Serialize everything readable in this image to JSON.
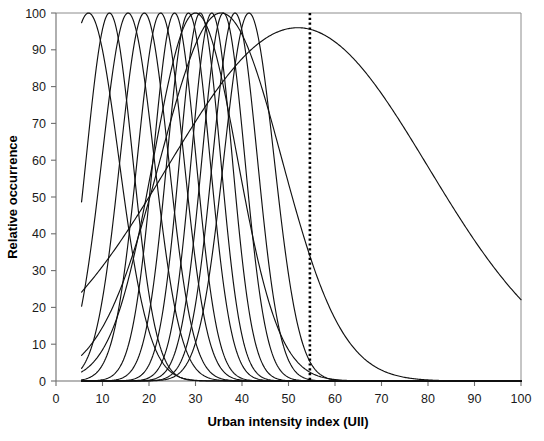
{
  "chart_data": {
    "type": "line",
    "title": "",
    "xlabel": "Urban intensity index (UII)",
    "ylabel": "Relative occurrence",
    "xlim": [
      0,
      100
    ],
    "ylim": [
      0,
      100
    ],
    "xticks": [
      0,
      10,
      20,
      30,
      40,
      50,
      60,
      70,
      80,
      90,
      100
    ],
    "yticks": [
      0,
      10,
      20,
      30,
      40,
      50,
      60,
      70,
      80,
      90,
      100
    ],
    "xtick_labels": [
      "0",
      "10",
      "20",
      "30",
      "40",
      "50",
      "60",
      "70",
      "80",
      "90",
      "100"
    ],
    "ytick_labels": [
      "0",
      "10",
      "20",
      "30",
      "40",
      "50",
      "60",
      "70",
      "80",
      "90",
      "100"
    ],
    "grid": false,
    "legend": "none",
    "x_domain_start": 5.5,
    "x_domain_end": 100,
    "curve_peak_value": 100,
    "annotations": [
      {
        "name": "uii-threshold-line",
        "type": "vertical-dotted-line",
        "x": 54.6,
        "color": "#000000",
        "style": "dotted"
      }
    ],
    "series": [
      {
        "name": "curve-01",
        "peak": 7.0,
        "width": 6.5,
        "peak_value": 100
      },
      {
        "name": "curve-02",
        "peak": 11.5,
        "width": 5.0,
        "peak_value": 100
      },
      {
        "name": "curve-03",
        "peak": 15.5,
        "width": 5.6,
        "peak_value": 100
      },
      {
        "name": "curve-04",
        "peak": 19.0,
        "width": 5.2,
        "peak_value": 100
      },
      {
        "name": "curve-05",
        "peak": 22.5,
        "width": 5.0,
        "peak_value": 100
      },
      {
        "name": "curve-06",
        "peak": 25.5,
        "width": 4.6,
        "peak_value": 100
      },
      {
        "name": "curve-07",
        "peak": 28.5,
        "width": 4.6,
        "peak_value": 100
      },
      {
        "name": "curve-08",
        "peak": 31.0,
        "width": 4.4,
        "peak_value": 100
      },
      {
        "name": "curve-09",
        "peak": 33.5,
        "width": 4.4,
        "peak_value": 100
      },
      {
        "name": "curve-10",
        "peak": 36.0,
        "width": 4.6,
        "peak_value": 100
      },
      {
        "name": "curve-11",
        "peak": 38.5,
        "width": 4.8,
        "peak_value": 100
      },
      {
        "name": "curve-12",
        "peak": 41.5,
        "width": 5.4,
        "peak_value": 100
      },
      {
        "name": "curve-13",
        "peak": 30.0,
        "width": 9.0,
        "peak_value": 100
      },
      {
        "name": "curve-14",
        "peak": 35.5,
        "width": 13.0,
        "peak_value": 100
      },
      {
        "name": "curve-15",
        "peak": 52.0,
        "width": 28.0,
        "peak_value": 96
      }
    ]
  },
  "axes": {
    "x_axis_title": "Urban intensity index (UII)",
    "y_axis_title": "Relative occurrence"
  }
}
